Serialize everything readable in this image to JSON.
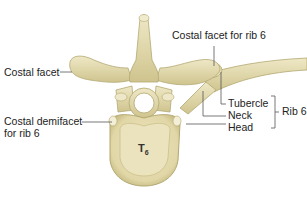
{
  "diagram": {
    "vertebra_label": "T",
    "vertebra_label_sub": "6",
    "labels": {
      "costal_facet": "Costal facet",
      "costal_facet_rib6": "Costal facet for rib 6",
      "costal_demifacet_line1": "Costal demifacet",
      "costal_demifacet_line2": "for rib 6",
      "tubercle": "Tubercle",
      "neck": "Neck",
      "head": "Head",
      "rib6": "Rib 6"
    },
    "colors": {
      "bone": "#e4dcb0",
      "bone_shadow": "#b9ae78",
      "bone_highlight": "#f6f1d8",
      "leader_line": "#555555",
      "text": "#222222"
    }
  }
}
